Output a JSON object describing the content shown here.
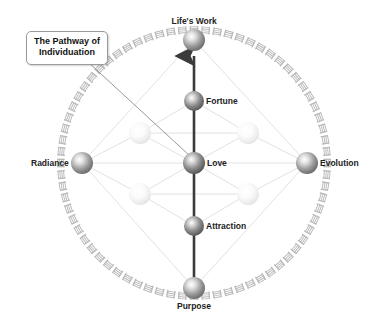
{
  "diagram": {
    "title_callout": {
      "line1": "The Pathway of",
      "line2": "Individuation"
    },
    "background_color": "#ffffff",
    "ring": {
      "name": "glyph-ring",
      "stroke_color": "#b9b9b9",
      "mark_count": 72,
      "center_x": 194,
      "center_y": 163,
      "radius": 133
    },
    "axis_arrow": {
      "name": "vertical-pathway-arrow",
      "color": "#3b3b3b",
      "from": "Purpose",
      "to": "Life's Work"
    },
    "lattice_line_color": "#e2e2e2",
    "leader_line_color": "#8d8d8d",
    "nodes": [
      {
        "id": "lifes-work",
        "label": "Life's Work",
        "x": 194,
        "y": 40,
        "r": 11,
        "kind": "primary",
        "label_position": "above",
        "color": "#6d6d6d"
      },
      {
        "id": "fortune",
        "label": "Fortune",
        "x": 194,
        "y": 101,
        "r": 10,
        "kind": "primary",
        "label_position": "right",
        "color": "#5e5e5e"
      },
      {
        "id": "love",
        "label": "Love",
        "x": 194,
        "y": 163,
        "r": 11,
        "kind": "primary",
        "label_position": "right",
        "color": "#5e5e5e"
      },
      {
        "id": "attraction",
        "label": "Attraction",
        "x": 194,
        "y": 226,
        "r": 10,
        "kind": "primary",
        "label_position": "right",
        "color": "#5e5e5e"
      },
      {
        "id": "purpose",
        "label": "Purpose",
        "x": 194,
        "y": 288,
        "r": 11,
        "kind": "primary",
        "label_position": "below",
        "color": "#6d6d6d"
      },
      {
        "id": "radiance",
        "label": "Radiance",
        "x": 82,
        "y": 163,
        "r": 11,
        "kind": "primary",
        "label_position": "left",
        "color": "#767676"
      },
      {
        "id": "evolution",
        "label": "Evolution",
        "x": 307,
        "y": 163,
        "r": 11,
        "kind": "primary",
        "label_position": "right",
        "color": "#6d6d6d"
      },
      {
        "id": "faint-upper-left",
        "label": "",
        "x": 140,
        "y": 133,
        "r": 11,
        "kind": "faint",
        "label_position": "none",
        "color": "#e7e7e7"
      },
      {
        "id": "faint-upper-right",
        "x": 248,
        "y": 133,
        "label": "",
        "r": 11,
        "kind": "faint",
        "label_position": "none",
        "color": "#f0f0f0"
      },
      {
        "id": "faint-lower-left",
        "label": "",
        "x": 140,
        "y": 194,
        "r": 11,
        "kind": "faint",
        "label_position": "none",
        "color": "#e9e9e9"
      },
      {
        "id": "faint-lower-right",
        "label": "",
        "x": 248,
        "y": 194,
        "r": 11,
        "kind": "faint",
        "label_position": "none",
        "color": "#eeeeee"
      }
    ],
    "lattice_edges": [
      [
        "radiance",
        "faint-upper-left"
      ],
      [
        "radiance",
        "faint-lower-left"
      ],
      [
        "radiance",
        "love"
      ],
      [
        "radiance",
        "lifes-work"
      ],
      [
        "radiance",
        "purpose"
      ],
      [
        "evolution",
        "faint-upper-right"
      ],
      [
        "evolution",
        "faint-lower-right"
      ],
      [
        "evolution",
        "love"
      ],
      [
        "evolution",
        "lifes-work"
      ],
      [
        "evolution",
        "purpose"
      ],
      [
        "faint-upper-left",
        "love"
      ],
      [
        "faint-upper-right",
        "love"
      ],
      [
        "faint-lower-left",
        "love"
      ],
      [
        "faint-lower-right",
        "love"
      ],
      [
        "faint-upper-left",
        "fortune"
      ],
      [
        "faint-upper-right",
        "fortune"
      ],
      [
        "faint-lower-left",
        "attraction"
      ],
      [
        "faint-lower-right",
        "attraction"
      ],
      [
        "faint-upper-left",
        "faint-upper-right"
      ],
      [
        "faint-lower-left",
        "faint-lower-right"
      ]
    ]
  }
}
